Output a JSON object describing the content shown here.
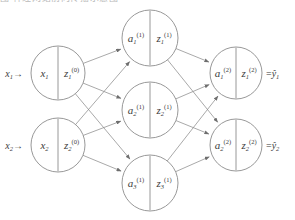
{
  "figure": {
    "type": "neural-network-diagram",
    "truncated_header_text": "图  神经网络前向传播示意图",
    "stroke_color": "#8c8c8c",
    "text_color": "#3b3b3b",
    "background_color": "#ffffff"
  },
  "layers": [
    {
      "name": "input-layer",
      "index": 0,
      "nodes": [
        {
          "id": "input-1",
          "cx": 58,
          "cy": 73,
          "r": 27,
          "left_base": "x",
          "left_sub": "1",
          "left_sup": "",
          "right_base": "z",
          "right_sub": "1",
          "right_sup": "(0)",
          "external_left": {
            "base": "x",
            "sub": "1",
            "arrow": "→"
          },
          "external_right": null
        },
        {
          "id": "input-2",
          "cx": 58,
          "cy": 145,
          "r": 27,
          "left_base": "x",
          "left_sub": "2",
          "left_sup": "",
          "right_base": "z",
          "right_sub": "2",
          "right_sup": "(0)",
          "external_left": {
            "base": "x",
            "sub": "2",
            "arrow": "→"
          },
          "external_right": null
        }
      ]
    },
    {
      "name": "hidden-layer",
      "index": 1,
      "nodes": [
        {
          "id": "hidden-1",
          "cx": 150,
          "cy": 38,
          "r": 28,
          "left_base": "a",
          "left_sub": "1",
          "left_sup": "(1)",
          "right_base": "z",
          "right_sub": "1",
          "right_sup": "(1)",
          "external_left": null,
          "external_right": null
        },
        {
          "id": "hidden-2",
          "cx": 150,
          "cy": 110,
          "r": 28,
          "left_base": "a",
          "left_sub": "2",
          "left_sup": "(1)",
          "right_base": "z",
          "right_sub": "2",
          "right_sup": "(1)",
          "external_left": null,
          "external_right": null
        },
        {
          "id": "hidden-3",
          "cx": 150,
          "cy": 183,
          "r": 28,
          "left_base": "a",
          "left_sub": "3",
          "left_sup": "(1)",
          "right_base": "z",
          "right_sub": "3",
          "right_sup": "(1)",
          "external_left": null,
          "external_right": null
        }
      ]
    },
    {
      "name": "output-layer",
      "index": 2,
      "nodes": [
        {
          "id": "output-1",
          "cx": 236,
          "cy": 73,
          "r": 26,
          "left_base": "a",
          "left_sub": "1",
          "left_sup": "(2)",
          "right_base": "z",
          "right_sub": "1",
          "right_sup": "(2)",
          "external_left": null,
          "external_right": {
            "equals": "=",
            "base": "ŷ",
            "sub": "1"
          }
        },
        {
          "id": "output-2",
          "cx": 236,
          "cy": 145,
          "r": 26,
          "left_base": "a",
          "left_sub": "2",
          "left_sup": "(2)",
          "right_base": "z",
          "right_sub": "2",
          "right_sup": "(2)",
          "external_left": null,
          "external_right": {
            "equals": "=",
            "base": "ŷ",
            "sub": "2"
          }
        }
      ]
    }
  ],
  "edges": [
    {
      "from": "input-1",
      "to": "hidden-1"
    },
    {
      "from": "input-1",
      "to": "hidden-2"
    },
    {
      "from": "input-1",
      "to": "hidden-3"
    },
    {
      "from": "input-2",
      "to": "hidden-1"
    },
    {
      "from": "input-2",
      "to": "hidden-2"
    },
    {
      "from": "input-2",
      "to": "hidden-3"
    },
    {
      "from": "hidden-1",
      "to": "output-1"
    },
    {
      "from": "hidden-1",
      "to": "output-2"
    },
    {
      "from": "hidden-2",
      "to": "output-1"
    },
    {
      "from": "hidden-2",
      "to": "output-2"
    },
    {
      "from": "hidden-3",
      "to": "output-1"
    },
    {
      "from": "hidden-3",
      "to": "output-2"
    }
  ]
}
